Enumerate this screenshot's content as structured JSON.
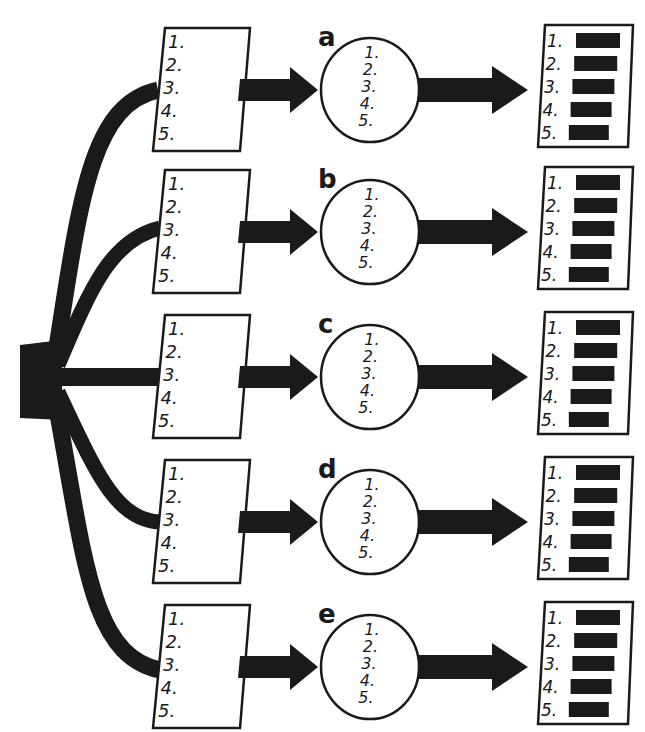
{
  "diagram": {
    "colors": {
      "ink": "#1a1a1a",
      "paper": "#ffffff"
    },
    "source": {
      "shape": "branching-trunk",
      "branches": 5
    },
    "rows": [
      {
        "id": "a",
        "label": "a",
        "input_list": [
          "1.",
          "2.",
          "3.",
          "4.",
          "5."
        ],
        "circle_list": [
          "1.",
          "2.",
          "3.",
          "4.",
          "5."
        ],
        "output_list": [
          "1.",
          "2.",
          "3.",
          "4.",
          "5."
        ],
        "output_bars": "filled"
      },
      {
        "id": "b",
        "label": "b",
        "input_list": [
          "1.",
          "2.",
          "3.",
          "4.",
          "5."
        ],
        "circle_list": [
          "1.",
          "2.",
          "3.",
          "4.",
          "5."
        ],
        "output_list": [
          "1.",
          "2.",
          "3.",
          "4.",
          "5."
        ],
        "output_bars": "filled"
      },
      {
        "id": "c",
        "label": "c",
        "input_list": [
          "1.",
          "2.",
          "3.",
          "4.",
          "5."
        ],
        "circle_list": [
          "1.",
          "2.",
          "3.",
          "4.",
          "5."
        ],
        "output_list": [
          "1.",
          "2.",
          "3.",
          "4.",
          "5."
        ],
        "output_bars": "filled"
      },
      {
        "id": "d",
        "label": "d",
        "input_list": [
          "1.",
          "2.",
          "3.",
          "4.",
          "5."
        ],
        "circle_list": [
          "1.",
          "2.",
          "3.",
          "4.",
          "5."
        ],
        "output_list": [
          "1.",
          "2.",
          "3.",
          "4.",
          "5."
        ],
        "output_bars": "filled"
      },
      {
        "id": "e",
        "label": "e",
        "input_list": [
          "1.",
          "2.",
          "3.",
          "4.",
          "5."
        ],
        "circle_list": [
          "1.",
          "2.",
          "3.",
          "4.",
          "5."
        ],
        "output_list": [
          "1.",
          "2.",
          "3.",
          "4.",
          "5."
        ],
        "output_bars": "filled"
      }
    ]
  }
}
